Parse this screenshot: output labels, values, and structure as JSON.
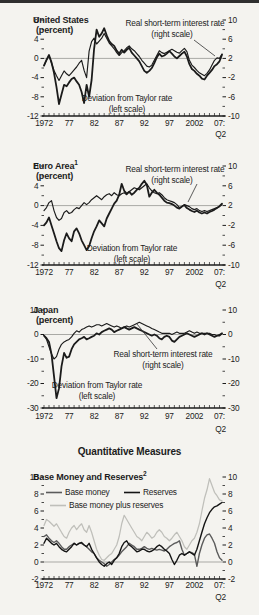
{
  "section_heading": "Quantitative Measures",
  "colors": {
    "line_black": "#1b1b1b",
    "base_money": "#5b5b5b",
    "reserves": "#141414",
    "base_money_plus_reserves": "#bfbfba",
    "zero_line": "#a9a9a5",
    "axis": "#1c1c1c",
    "background": "#f4f3ef"
  },
  "chart_data": [
    {
      "type": "line",
      "title": "United States",
      "title_sup": "",
      "units_label": "(percent)",
      "x_start": 1972,
      "x_step": 0.5,
      "x_min": 1972,
      "x_max": 2007.5,
      "x_ticks": [
        {
          "year": 1972,
          "label": "1972"
        },
        {
          "year": 1977,
          "label": "77"
        },
        {
          "year": 1982,
          "label": "82"
        },
        {
          "year": 1987,
          "label": "87"
        },
        {
          "year": 1992,
          "label": "92"
        },
        {
          "year": 1997,
          "label": "97"
        },
        {
          "year": 2002,
          "label": "2002"
        },
        {
          "year": 2007,
          "label": "07:"
        }
      ],
      "x_sub": "Q2",
      "left_axis": {
        "min": -12,
        "max": 8,
        "majors": [
          8,
          4,
          0,
          -4,
          -8,
          -12
        ]
      },
      "right_axis": {
        "min": -10,
        "max": 10,
        "majors": [
          10,
          6,
          2,
          -2,
          -6,
          -10
        ]
      },
      "annotations": {
        "real_rate_line1": "Real short-term interest rate",
        "real_rate_line2": "(right scale)",
        "deviation_line1": "Deviation from Taylor rate",
        "deviation_line2": "(left scale)"
      },
      "series": [
        {
          "name": "Deviation from Taylor rate",
          "scale": "left",
          "color": "#1b1b1b",
          "values": [
            -1.5,
            -0.3,
            0.7,
            -0.8,
            -3,
            -6,
            -9.5,
            -7.5,
            -5.5,
            -5.8,
            -5,
            -4.3,
            -4,
            -4.8,
            -5.5,
            -7,
            -9.3,
            -5.5,
            -8,
            -4.5,
            2,
            6,
            4.5,
            5.2,
            6.3,
            4.8,
            3.6,
            3,
            2.6,
            1.6,
            1,
            1.8,
            1.2,
            1.8,
            2.2,
            1.2,
            0.6,
            0,
            -0.6,
            -1.6,
            -2.6,
            -3,
            -2.6,
            -2,
            -1,
            0.2,
            1,
            0.4,
            0.6,
            1,
            1.5,
            1,
            0.4,
            0,
            0.5,
            1,
            1.4,
            0.4,
            -1.2,
            -2.2,
            -2.6,
            -3.2,
            -3.6,
            -4.2,
            -4.4,
            -3.6,
            -3,
            -2.4,
            -1.6,
            -1.2,
            -0.6,
            0.8
          ]
        },
        {
          "name": "Real short-term interest rate",
          "scale": "right",
          "color": "#1b1b1b",
          "values": [
            0.5,
            1.6,
            2.6,
            1,
            -0.5,
            -1.6,
            -2.6,
            -1.6,
            -0.6,
            -1.2,
            -1.6,
            -1,
            -0.4,
            0.2,
            1,
            1.6,
            -0.5,
            -2,
            3.5,
            5.5,
            6.2,
            5,
            5.6,
            6.2,
            7.2,
            6.2,
            5.2,
            4.6,
            4,
            3.2,
            2.6,
            3.2,
            3.6,
            4.2,
            4.6,
            4,
            3.6,
            3,
            2.4,
            1.6,
            1,
            0.4,
            0.2,
            0.6,
            1.6,
            2.6,
            3.6,
            3.2,
            3,
            3.3,
            3.6,
            3.9,
            3.6,
            3.3,
            3.1,
            3.6,
            4.1,
            3.4,
            1.6,
            0.6,
            0.1,
            -0.5,
            -1,
            -1.3,
            -1.6,
            -1.1,
            -0.4,
            0.6,
            1.6,
            2.1,
            2,
            2.9
          ]
        }
      ]
    },
    {
      "type": "line",
      "title": "Euro Area",
      "title_sup": "1",
      "units_label": "(percent)",
      "x_start": 1972,
      "x_step": 0.5,
      "x_min": 1972,
      "x_max": 2007.5,
      "x_ticks": [
        {
          "year": 1972,
          "label": "1972"
        },
        {
          "year": 1977,
          "label": "77"
        },
        {
          "year": 1982,
          "label": "82"
        },
        {
          "year": 1987,
          "label": "87"
        },
        {
          "year": 1992,
          "label": "92"
        },
        {
          "year": 1997,
          "label": "97"
        },
        {
          "year": 2002,
          "label": "2002"
        },
        {
          "year": 2007,
          "label": "07:"
        }
      ],
      "x_sub": "Q2",
      "left_axis": {
        "min": -12,
        "max": 8,
        "majors": [
          8,
          4,
          0,
          -4,
          -8,
          -12
        ]
      },
      "right_axis": {
        "min": -10,
        "max": 10,
        "majors": [
          10,
          6,
          2,
          -2,
          -6,
          -10
        ]
      },
      "annotations": {
        "real_rate_line1": "Real short-term interest rate",
        "real_rate_line2": "(right scale)",
        "deviation_line1": "Deviation from Taylor rate",
        "deviation_line2": "(left scale)"
      },
      "series": [
        {
          "name": "Deviation from Taylor rate",
          "scale": "left",
          "color": "#1b1b1b",
          "values": [
            -4,
            -3.4,
            -2.4,
            -4,
            -5.6,
            -7.2,
            -8.6,
            -9.2,
            -7,
            -5.6,
            -6.6,
            -7.2,
            -5.2,
            -4.6,
            -5.6,
            -7,
            -8,
            -9,
            -8.2,
            -6.6,
            -5.2,
            -4.2,
            -3,
            -3.6,
            -4.2,
            -2.6,
            -1.6,
            -0.6,
            0.4,
            1,
            2.2,
            4.4,
            3,
            2.4,
            2.8,
            2.2,
            2.6,
            3.2,
            3.6,
            4.4,
            5,
            4.2,
            1.8,
            2.6,
            3.2,
            2.6,
            2.2,
            1.6,
            1,
            0.6,
            0.5,
            0.3,
            0,
            -0.4,
            -0.6,
            -0.2,
            0.1,
            -0.5,
            -0.8,
            -1.1,
            -1.3,
            -1,
            -1.4,
            -1.6,
            -1.4,
            -1.6,
            -1.3,
            -1.1,
            -0.8,
            -0.5,
            -0.1,
            0.4
          ]
        },
        {
          "name": "Real short-term interest rate",
          "scale": "right",
          "color": "#1b1b1b",
          "values": [
            1,
            1.6,
            2.6,
            3,
            1,
            -0.4,
            -1,
            -0.6,
            0.6,
            1,
            0.4,
            0.6,
            1.2,
            1.6,
            1.4,
            2,
            2.6,
            2.2,
            2.6,
            3.2,
            3.6,
            4,
            3.6,
            3.2,
            3.8,
            4.2,
            4.4,
            4,
            4.6,
            4.2,
            4,
            4.4,
            4.6,
            4.2,
            4.8,
            5.2,
            5.6,
            5.4,
            5.2,
            5.6,
            6,
            6.4,
            5.6,
            5,
            4.6,
            4.4,
            4.6,
            4.2,
            3.6,
            3.2,
            3,
            2.8,
            2.6,
            2.2,
            1.6,
            1.8,
            2.2,
            2,
            1.8,
            1.4,
            1.2,
            1.4,
            1,
            0.8,
            1,
            0.8,
            1,
            1.2,
            1.4,
            1.6,
            1.8,
            2.2
          ]
        }
      ]
    },
    {
      "type": "line",
      "title": "Japan",
      "title_sup": "",
      "units_label": "(percent)",
      "x_start": 1972,
      "x_step": 0.5,
      "x_min": 1972,
      "x_max": 2007.5,
      "x_ticks": [
        {
          "year": 1972,
          "label": "1972"
        },
        {
          "year": 1977,
          "label": "77"
        },
        {
          "year": 1982,
          "label": "82"
        },
        {
          "year": 1987,
          "label": "87"
        },
        {
          "year": 1992,
          "label": "92"
        },
        {
          "year": 1997,
          "label": "97"
        },
        {
          "year": 2002,
          "label": "2002"
        },
        {
          "year": 2007,
          "label": "07:"
        }
      ],
      "x_sub": "Q2",
      "left_axis": {
        "min": -30,
        "max": 10,
        "majors": [
          10,
          0,
          -10,
          -20,
          -30
        ]
      },
      "right_axis": {
        "min": -30,
        "max": 10,
        "majors": [
          10,
          0,
          -10,
          -20,
          -30
        ]
      },
      "annotations": {
        "real_rate_line1": "Real short-term interest rate",
        "real_rate_line2": "(right scale)",
        "deviation_line1": "Deviation from Taylor rate",
        "deviation_line2": "(left scale)"
      },
      "series": [
        {
          "name": "Deviation from Taylor rate",
          "scale": "left",
          "color": "#1b1b1b",
          "values": [
            -0.5,
            -1.5,
            -3,
            -8,
            -17,
            -26,
            -22,
            -13,
            -7.5,
            -9.5,
            -9,
            -6,
            -4,
            -3,
            -2,
            -1.5,
            -1,
            -2,
            -1.5,
            -1,
            -0.5,
            0.5,
            0,
            1,
            1.5,
            2,
            2.5,
            2,
            1,
            1.5,
            2,
            2.5,
            3,
            2.5,
            2,
            2.5,
            3,
            2.5,
            2,
            1.5,
            1,
            0.5,
            0,
            -0.5,
            0,
            -0.5,
            -1.5,
            -2,
            -1,
            -0.5,
            -1,
            -2.5,
            -3,
            -2,
            -1,
            -0.5,
            0,
            0.5,
            0,
            -0.5,
            -1,
            -0.5,
            0,
            0.5,
            0,
            0.5,
            0,
            -0.5,
            -1,
            -0.5,
            -0.5,
            0.5
          ]
        },
        {
          "name": "Real short-term interest rate",
          "scale": "right",
          "color": "#1b1b1b",
          "values": [
            -0.5,
            -2,
            -5,
            -8,
            -10,
            -9,
            -6,
            -4,
            -3,
            -2.5,
            -2,
            -1,
            0.5,
            1.5,
            1,
            2,
            2.5,
            3,
            3.5,
            3,
            3.5,
            4,
            4,
            3.5,
            4,
            4.5,
            4,
            3.5,
            3,
            3.5,
            3,
            2.5,
            3,
            3.5,
            3,
            3.5,
            4,
            4.5,
            5,
            4.5,
            4,
            3.5,
            3,
            2.5,
            2,
            1.5,
            1,
            0.5,
            0.5,
            0.5,
            0.5,
            0,
            0.5,
            1,
            0.5,
            0.5,
            0.5,
            1,
            1.5,
            1,
            0.5,
            1,
            0.5,
            0.5,
            0.5,
            0.5,
            0.5,
            0,
            0,
            -0.5,
            0,
            0.5
          ]
        }
      ]
    },
    {
      "type": "line",
      "title": "Base Money and Reserves",
      "title_sup": "2",
      "units_label": "",
      "x_start": 1972,
      "x_step": 0.5,
      "x_min": 1972,
      "x_max": 2007.5,
      "x_ticks": [
        {
          "year": 1972,
          "label": "1972"
        },
        {
          "year": 1977,
          "label": "77"
        },
        {
          "year": 1982,
          "label": "82"
        },
        {
          "year": 1987,
          "label": "87"
        },
        {
          "year": 1992,
          "label": "92"
        },
        {
          "year": 1997,
          "label": "97"
        },
        {
          "year": 2002,
          "label": "2002"
        },
        {
          "year": 2007,
          "label": "07:"
        }
      ],
      "x_sub": "Q2",
      "left_axis": {
        "min": -2,
        "max": 10,
        "majors": [
          10,
          8,
          6,
          4,
          2,
          0,
          -2
        ]
      },
      "right_axis": {
        "min": -2,
        "max": 10,
        "majors": [
          10,
          8,
          6,
          4,
          2,
          0,
          -2
        ]
      },
      "legend_position": "top-left",
      "series": [
        {
          "name": "Base money",
          "scale": "left",
          "color": "#5b5b5b",
          "values": [
            3,
            3.2,
            2.8,
            2.5,
            2.3,
            2.5,
            2.2,
            1.8,
            1.5,
            1.5,
            1.8,
            2,
            2.2,
            2,
            2.2,
            2.2,
            2,
            1.8,
            1.5,
            1.2,
            1,
            0.5,
            0.2,
            0,
            -0.2,
            -0.5,
            -0.3,
            0,
            0.3,
            0.5,
            0.8,
            1.2,
            1.5,
            1.8,
            2.2,
            2,
            1.8,
            1.5,
            1.5,
            1.6,
            1.8,
            1.6,
            1.5,
            1.6,
            1.5,
            1.4,
            1.5,
            1.4,
            1.3,
            1.5,
            1.8,
            2,
            2.2,
            2.3,
            2.5,
            1.5,
            0.8,
            1,
            1.2,
            1.1,
            0.9,
            -0.5,
            1,
            2,
            2.8,
            3.2,
            3.3,
            2.8,
            2.2,
            1.2,
            0.5,
            0.2
          ]
        },
        {
          "name": "Reserves",
          "scale": "left",
          "color": "#141414",
          "values": [
            2.2,
            2.8,
            2.5,
            2.2,
            2,
            2.2,
            1.8,
            1.5,
            1.3,
            1.2,
            1.5,
            1.8,
            2.2,
            2,
            2.2,
            2.3,
            2,
            1.8,
            2.2,
            1.5,
            1,
            0.5,
            0,
            -0.3,
            -0.5,
            -0.2,
            0,
            -0.3,
            0.2,
            0.5,
            1,
            1.8,
            2.3,
            2.5,
            2,
            1.8,
            1.5,
            1.2,
            1.3,
            1.5,
            1.5,
            1.3,
            1.2,
            1.3,
            1.5,
            1.8,
            2,
            1.8,
            1.5,
            1.3,
            1,
            0.3,
            -0.3,
            0.2,
            0.8,
            1,
            0.8,
            1,
            1.2,
            1,
            0.8,
            1.5,
            2.5,
            3.5,
            4.5,
            5.2,
            5.8,
            6.2,
            6.5,
            6.6,
            6.8,
            7
          ]
        },
        {
          "name": "Base money plus reserves",
          "scale": "left",
          "color": "#bfbfba",
          "values": [
            4.3,
            5,
            4.8,
            4.5,
            4.2,
            4.5,
            4,
            3.5,
            3,
            2.8,
            3.5,
            4,
            4.3,
            3.8,
            4.2,
            4.5,
            3.8,
            3.5,
            4.3,
            3.5,
            2.5,
            1.5,
            0.8,
            0.3,
            0.2,
            0.5,
            0.8,
            1,
            1.5,
            2,
            3,
            4.5,
            5.5,
            5,
            4.5,
            4,
            3.5,
            3,
            2.8,
            2.5,
            3,
            3.5,
            3.2,
            2.8,
            3,
            3.5,
            3.8,
            3.5,
            3,
            2.8,
            2.5,
            2.8,
            3.2,
            3.5,
            3,
            2.5,
            1.8,
            1.5,
            2,
            2.5,
            2.8,
            3.5,
            4.5,
            6,
            7.5,
            8.5,
            9.8,
            9,
            8.2,
            7.8,
            7.3,
            7.2
          ]
        }
      ]
    }
  ]
}
